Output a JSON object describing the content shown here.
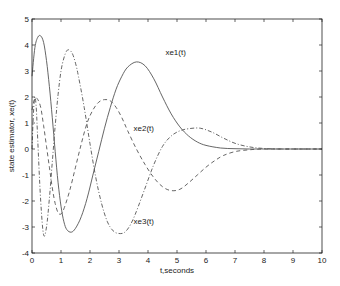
{
  "chart_data": {
    "type": "line",
    "title": "",
    "xlabel": "t,seconds",
    "ylabel": "state estimator, xe(t)",
    "xlim": [
      0,
      10
    ],
    "ylim": [
      -4,
      5
    ],
    "xticks": [
      0,
      1,
      2,
      3,
      4,
      5,
      6,
      7,
      8,
      9,
      10
    ],
    "yticks": [
      -4,
      -3,
      -2,
      -1,
      0,
      1,
      2,
      3,
      4,
      5
    ],
    "grid": false,
    "legend_position": "inline labels",
    "series": [
      {
        "name": "xe1(t)",
        "style": "solid",
        "label_pos": [
          4.6,
          3.6
        ],
        "x": [
          0,
          0.1,
          0.2,
          0.3,
          0.4,
          0.5,
          0.6,
          0.7,
          0.8,
          0.9,
          1.0,
          1.1,
          1.2,
          1.35,
          1.5,
          1.7,
          1.9,
          2.1,
          2.3,
          2.5,
          2.7,
          2.9,
          3.1,
          3.3,
          3.6,
          3.9,
          4.2,
          4.5,
          4.8,
          5.1,
          5.4,
          5.7,
          6.0,
          6.5,
          7.0,
          7.5,
          8.0,
          9.0,
          10.0
        ],
        "y": [
          2.8,
          3.9,
          4.3,
          4.35,
          4.1,
          3.4,
          2.4,
          1.2,
          -0.1,
          -1.3,
          -2.2,
          -2.8,
          -3.1,
          -3.2,
          -3.05,
          -2.6,
          -1.9,
          -1.0,
          -0.1,
          0.8,
          1.6,
          2.3,
          2.8,
          3.15,
          3.35,
          3.2,
          2.7,
          2.0,
          1.35,
          0.85,
          0.5,
          0.27,
          0.14,
          0.04,
          0.01,
          0.0,
          0.0,
          0.0,
          0.0
        ]
      },
      {
        "name": "xe2(t)",
        "style": "dashed",
        "label_pos": [
          3.5,
          0.7
        ],
        "x": [
          0,
          0.1,
          0.2,
          0.3,
          0.4,
          0.5,
          0.6,
          0.7,
          0.8,
          0.9,
          1.0,
          1.1,
          1.3,
          1.5,
          1.7,
          1.9,
          2.1,
          2.3,
          2.5,
          2.7,
          2.9,
          3.1,
          3.3,
          3.6,
          3.9,
          4.2,
          4.5,
          4.8,
          5.1,
          5.4,
          5.7,
          6.0,
          6.3,
          6.6,
          7.0,
          7.5,
          8.0,
          9.0,
          10.0
        ],
        "y": [
          1.5,
          1.95,
          1.9,
          1.6,
          0.9,
          0.1,
          -0.7,
          -1.5,
          -2.1,
          -2.45,
          -2.5,
          -2.3,
          -1.6,
          -0.7,
          0.2,
          1.0,
          1.5,
          1.8,
          1.9,
          1.85,
          1.6,
          1.2,
          0.7,
          0.0,
          -0.6,
          -1.1,
          -1.45,
          -1.6,
          -1.55,
          -1.3,
          -1.0,
          -0.7,
          -0.45,
          -0.25,
          -0.1,
          -0.03,
          0.0,
          0.0,
          0.0
        ]
      },
      {
        "name": "xe3(t)",
        "style": "dashdot",
        "label_pos": [
          3.5,
          -2.9
        ],
        "x": [
          0,
          0.05,
          0.1,
          0.15,
          0.2,
          0.3,
          0.4,
          0.5,
          0.6,
          0.7,
          0.8,
          0.9,
          1.0,
          1.1,
          1.2,
          1.3,
          1.4,
          1.5,
          1.6,
          1.8,
          2.0,
          2.2,
          2.4,
          2.6,
          2.8,
          3.0,
          3.2,
          3.4,
          3.6,
          3.9,
          4.2,
          4.5,
          4.8,
          5.1,
          5.4,
          5.8,
          6.2,
          6.6,
          7.0,
          7.5,
          8.0,
          8.5,
          9.0,
          10.0
        ],
        "y": [
          0.0,
          1.4,
          2.0,
          1.5,
          0.3,
          -2.0,
          -3.3,
          -3.0,
          -1.9,
          -0.5,
          0.9,
          2.1,
          3.0,
          3.5,
          3.78,
          3.8,
          3.65,
          3.3,
          2.8,
          1.6,
          0.2,
          -1.1,
          -2.1,
          -2.8,
          -3.15,
          -3.25,
          -3.2,
          -2.9,
          -2.4,
          -1.5,
          -0.6,
          0.1,
          0.5,
          0.7,
          0.78,
          0.8,
          0.65,
          0.42,
          0.22,
          0.08,
          0.02,
          0.0,
          0.0,
          0.0
        ]
      }
    ]
  },
  "colors": {
    "axis": "#222222",
    "line": "#555555",
    "background": "#ffffff"
  }
}
